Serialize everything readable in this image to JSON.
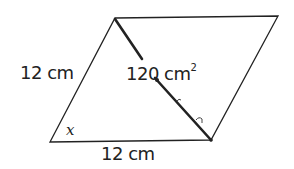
{
  "diagram": {
    "type": "parallelogram",
    "vertices": {
      "top_left": [
        115,
        18
      ],
      "top_right": [
        278,
        16
      ],
      "bottom_right": [
        211,
        140
      ],
      "bottom_left": [
        50,
        142
      ]
    },
    "labels": {
      "left_side": "12 cm",
      "bottom_side": "12 cm",
      "area": "120 cm",
      "area_exponent": "2",
      "angle": "x"
    },
    "colors": {
      "stroke": "#222222",
      "background": "#ffffff"
    }
  }
}
